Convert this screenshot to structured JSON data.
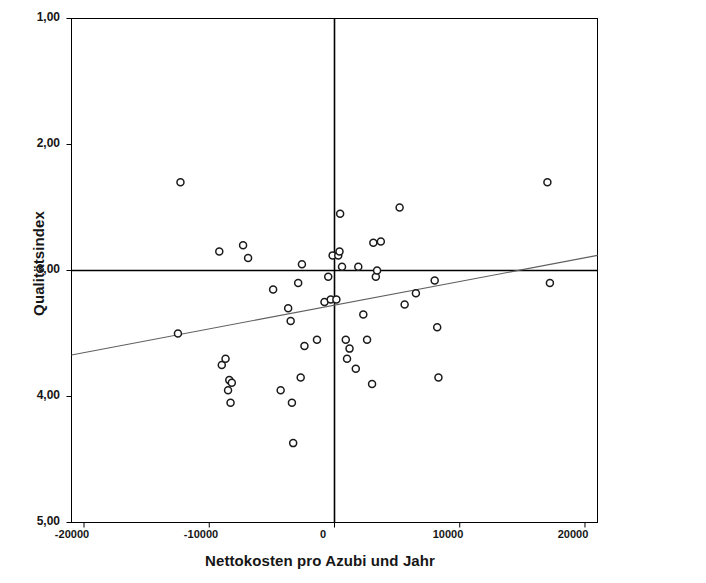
{
  "chart_data": {
    "type": "scatter",
    "title": "",
    "xlabel": "Nettokosten pro Azubi und Jahr",
    "ylabel": "Qualitätsindex",
    "xlim": [
      -21000,
      21000
    ],
    "ylim": [
      1.0,
      5.0
    ],
    "y_axis_inverted": true,
    "grid": false,
    "legend": null,
    "xticks": [
      -20000,
      -10000,
      0,
      10000,
      20000
    ],
    "xtick_labels": [
      "-20000",
      "-10000",
      "0",
      "10000",
      "20000"
    ],
    "yticks": [
      1.0,
      2.0,
      3.0,
      4.0,
      5.0
    ],
    "ytick_labels": [
      "1,00",
      "2,00",
      "3,00",
      "4,00",
      "5,00"
    ],
    "reference_lines": {
      "vertical_x": 0,
      "horizontal_y": 3.0
    },
    "annotations": [
      {
        "name": "quadrant-II",
        "text": "II",
        "x": -17500,
        "y": 1.25
      },
      {
        "name": "quadrant-I",
        "text": "I",
        "x": 17500,
        "y": 1.25
      },
      {
        "name": "quadrant-IV",
        "text": "IV",
        "x": -17500,
        "y": 4.65
      },
      {
        "name": "quadrant-III",
        "text": "III",
        "x": 17500,
        "y": 4.65
      },
      {
        "name": "r-squared",
        "text": "R² Linear = 0,071",
        "x": 9000,
        "y": 4.57
      }
    ],
    "r_squared_text": "R",
    "r_squared_sup": "2",
    "r_squared_rest": " Linear = 0,071",
    "fit_line": {
      "type": "linear",
      "x_start": -21000,
      "y_start": 3.67,
      "x_end": 21000,
      "y_end": 2.88,
      "color": "#606060"
    },
    "marker": {
      "shape": "circle-open",
      "edge_color": "#1a1a1a",
      "fill_color": "#ffffff",
      "size": 7
    },
    "points": [
      {
        "x": -12300,
        "y": 2.3
      },
      {
        "x": -12500,
        "y": 3.5
      },
      {
        "x": -9200,
        "y": 2.85
      },
      {
        "x": -9000,
        "y": 3.75
      },
      {
        "x": -8700,
        "y": 3.7
      },
      {
        "x": -8500,
        "y": 3.95
      },
      {
        "x": -8400,
        "y": 3.87
      },
      {
        "x": -8200,
        "y": 3.89
      },
      {
        "x": -8300,
        "y": 4.05
      },
      {
        "x": -7300,
        "y": 2.8
      },
      {
        "x": -6900,
        "y": 2.9
      },
      {
        "x": -4900,
        "y": 3.15
      },
      {
        "x": -4300,
        "y": 3.95
      },
      {
        "x": -3700,
        "y": 3.3
      },
      {
        "x": -3500,
        "y": 3.4
      },
      {
        "x": -3400,
        "y": 4.05
      },
      {
        "x": -3300,
        "y": 4.37
      },
      {
        "x": -2900,
        "y": 3.1
      },
      {
        "x": -2700,
        "y": 3.85
      },
      {
        "x": -2600,
        "y": 2.95
      },
      {
        "x": -2400,
        "y": 3.6
      },
      {
        "x": -1400,
        "y": 3.55
      },
      {
        "x": -800,
        "y": 3.25
      },
      {
        "x": -500,
        "y": 3.05
      },
      {
        "x": -300,
        "y": 3.23
      },
      {
        "x": -150,
        "y": 2.88
      },
      {
        "x": 150,
        "y": 3.23
      },
      {
        "x": 300,
        "y": 2.88
      },
      {
        "x": 400,
        "y": 2.85
      },
      {
        "x": 450,
        "y": 2.55
      },
      {
        "x": 600,
        "y": 2.97
      },
      {
        "x": 900,
        "y": 3.55
      },
      {
        "x": 1000,
        "y": 3.7
      },
      {
        "x": 1200,
        "y": 3.62
      },
      {
        "x": 1700,
        "y": 3.78
      },
      {
        "x": 1900,
        "y": 2.97
      },
      {
        "x": 2300,
        "y": 3.35
      },
      {
        "x": 2600,
        "y": 3.55
      },
      {
        "x": 3000,
        "y": 3.9
      },
      {
        "x": 3100,
        "y": 2.78
      },
      {
        "x": 3300,
        "y": 3.05
      },
      {
        "x": 3400,
        "y": 3.0
      },
      {
        "x": 3700,
        "y": 2.77
      },
      {
        "x": 5200,
        "y": 2.5
      },
      {
        "x": 5600,
        "y": 3.27
      },
      {
        "x": 6500,
        "y": 3.18
      },
      {
        "x": 8000,
        "y": 3.08
      },
      {
        "x": 8200,
        "y": 3.45
      },
      {
        "x": 8300,
        "y": 3.85
      },
      {
        "x": 17000,
        "y": 2.3
      },
      {
        "x": 17200,
        "y": 3.1
      }
    ]
  },
  "plot": {
    "frame_color": "#000000",
    "reference_line_color": "#000000",
    "background": "#ffffff"
  }
}
